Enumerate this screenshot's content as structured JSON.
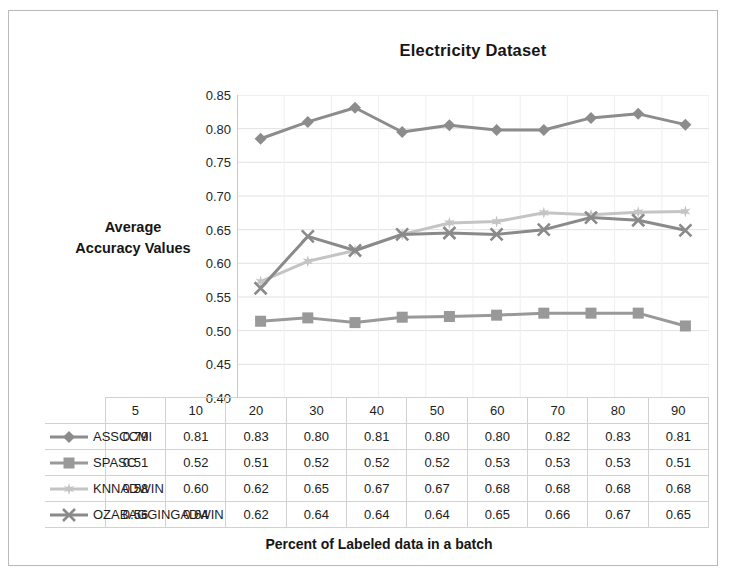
{
  "figure": {
    "title": "Electricity Dataset",
    "y_axis_title_line1": "Average",
    "y_axis_title_line2": "Accuracy Values",
    "x_axis_title": "Percent of Labeled data in a batch"
  },
  "chart_data": {
    "type": "line",
    "title": "Electricity Dataset",
    "xlabel": "Percent of Labeled data in a batch",
    "ylabel": "Average Accuracy Values",
    "categories": [
      "5",
      "10",
      "20",
      "30",
      "40",
      "50",
      "60",
      "70",
      "80",
      "90"
    ],
    "ylim": [
      0.4,
      0.85
    ],
    "ytick_labels": [
      "0.85",
      "0.80",
      "0.75",
      "0.70",
      "0.65",
      "0.60",
      "0.55",
      "0.50",
      "0.45",
      "0.40"
    ],
    "ytick_values": [
      0.85,
      0.8,
      0.75,
      0.7,
      0.65,
      0.6,
      0.55,
      0.5,
      0.45,
      0.4
    ],
    "grid": true,
    "legend_position": "table-below",
    "series": [
      {
        "name": "ASSCCMI",
        "marker": "diamond",
        "color": "#8c8c8c",
        "values": [
          0.79,
          0.81,
          0.83,
          0.8,
          0.81,
          0.8,
          0.8,
          0.82,
          0.83,
          0.81
        ],
        "plotted": [
          0.785,
          0.81,
          0.831,
          0.795,
          0.805,
          0.798,
          0.798,
          0.816,
          0.822,
          0.806
        ]
      },
      {
        "name": "SPASC",
        "marker": "square",
        "color": "#999999",
        "values": [
          0.51,
          0.52,
          0.51,
          0.52,
          0.52,
          0.52,
          0.53,
          0.53,
          0.53,
          0.51
        ],
        "plotted": [
          0.514,
          0.519,
          0.512,
          0.52,
          0.521,
          0.523,
          0.526,
          0.526,
          0.526,
          0.507
        ]
      },
      {
        "name": "KNNADWIN",
        "marker": "star",
        "color": "#c4c4c4",
        "values": [
          0.58,
          0.6,
          0.62,
          0.65,
          0.67,
          0.67,
          0.68,
          0.68,
          0.68,
          0.68
        ],
        "plotted": [
          0.573,
          0.603,
          0.619,
          0.643,
          0.66,
          0.662,
          0.675,
          0.672,
          0.676,
          0.677
        ]
      },
      {
        "name": "OZABAGGINGADWIN",
        "marker": "cross",
        "color": "#8a8a8a",
        "values": [
          0.56,
          0.64,
          0.62,
          0.64,
          0.64,
          0.64,
          0.65,
          0.66,
          0.67,
          0.65
        ],
        "plotted": [
          0.563,
          0.64,
          0.619,
          0.643,
          0.645,
          0.643,
          0.65,
          0.668,
          0.664,
          0.649
        ]
      }
    ]
  },
  "table": {
    "header": [
      "5",
      "10",
      "20",
      "30",
      "40",
      "50",
      "60",
      "70",
      "80",
      "90"
    ],
    "rows": [
      {
        "label": "ASSCCMI",
        "values": [
          "0.79",
          "0.81",
          "0.83",
          "0.80",
          "0.81",
          "0.80",
          "0.80",
          "0.82",
          "0.83",
          "0.81"
        ]
      },
      {
        "label": "SPASC",
        "values": [
          "0.51",
          "0.52",
          "0.51",
          "0.52",
          "0.52",
          "0.52",
          "0.53",
          "0.53",
          "0.53",
          "0.51"
        ]
      },
      {
        "label": "KNNADWIN",
        "values": [
          "0.58",
          "0.60",
          "0.62",
          "0.65",
          "0.67",
          "0.67",
          "0.68",
          "0.68",
          "0.68",
          "0.68"
        ]
      },
      {
        "label": "OZABAGGINGADWIN",
        "values": [
          "0.56",
          "0.64",
          "0.62",
          "0.64",
          "0.64",
          "0.64",
          "0.65",
          "0.66",
          "0.67",
          "0.65"
        ]
      }
    ]
  },
  "colors": {
    "gridline": "#e2e2e2",
    "axis": "#c9c9c9",
    "frame": "#b9b9b9",
    "text": "#1a1a1a"
  }
}
